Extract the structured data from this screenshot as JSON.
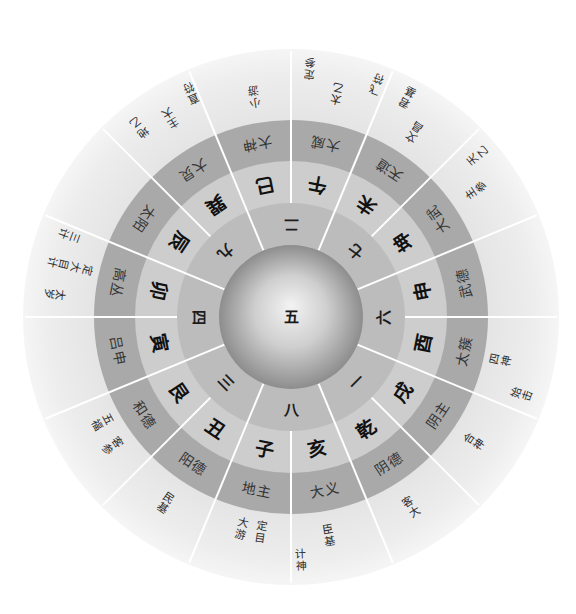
{
  "diagram": {
    "center_label": "五",
    "nine_palace_ring": [
      "二",
      "七",
      "六",
      "一",
      "八",
      "三",
      "四",
      "九"
    ],
    "palaces": [
      {
        "branch": "午",
        "god": "大威"
      },
      {
        "branch": "未",
        "god": "天道"
      },
      {
        "branch": "坤",
        "god": "大武"
      },
      {
        "branch": "申",
        "god": "武德"
      },
      {
        "branch": "酉",
        "god": "太簇"
      },
      {
        "branch": "戌",
        "god": "阴主"
      },
      {
        "branch": "乾",
        "god": "阴德"
      },
      {
        "branch": "亥",
        "god": "大义"
      },
      {
        "branch": "子",
        "god": "地主"
      },
      {
        "branch": "丑",
        "god": "阳德"
      },
      {
        "branch": "艮",
        "god": "和德"
      },
      {
        "branch": "寅",
        "god": "吕申"
      },
      {
        "branch": "卯",
        "god": "高丛"
      },
      {
        "branch": "辰",
        "god": "太阳"
      },
      {
        "branch": "巽",
        "god": "大炅"
      },
      {
        "branch": "巳",
        "god": "大神"
      }
    ],
    "outer_labels": [
      {
        "sector": "午",
        "text": "定参"
      },
      {
        "sector": "午",
        "text": "太乙"
      },
      {
        "sector": "午",
        "text": "飞符"
      },
      {
        "sector": "未",
        "text": "君基"
      },
      {
        "sector": "未",
        "text": "文昌"
      },
      {
        "sector": "坤",
        "text": "天乙"
      },
      {
        "sector": "坤",
        "text": "主参"
      },
      {
        "sector": "酉",
        "text": "四神"
      },
      {
        "sector": "酉",
        "text": "始击"
      },
      {
        "sector": "戌",
        "text": "合神"
      },
      {
        "sector": "乾",
        "text": "客大"
      },
      {
        "sector": "亥",
        "text": "臣基"
      },
      {
        "sector": "亥",
        "text": "计神"
      },
      {
        "sector": "子",
        "text": "定目"
      },
      {
        "sector": "子",
        "text": "大游"
      },
      {
        "sector": "丑",
        "text": "民基"
      },
      {
        "sector": "艮",
        "text": "客参"
      },
      {
        "sector": "艮",
        "text": "五福"
      },
      {
        "sector": "卯",
        "text": "太岁"
      },
      {
        "sector": "卯",
        "text": "定大目计"
      },
      {
        "sector": "卯",
        "text": "三计"
      },
      {
        "sector": "巽",
        "text": "地乙"
      },
      {
        "sector": "巽",
        "text": "主大"
      },
      {
        "sector": "巽",
        "text": "直符"
      },
      {
        "sector": "巳",
        "text": "小游"
      }
    ]
  },
  "colors": {
    "outer_ring": "#ececec",
    "god_ring": "#a9a9a9",
    "branch_ring": "#cdcdcd",
    "number_ring": "#bcbcbc",
    "spokes": "#ffffff",
    "sphere_highlight": "#f2f2f2",
    "sphere_edge": "#8f8f8f"
  }
}
